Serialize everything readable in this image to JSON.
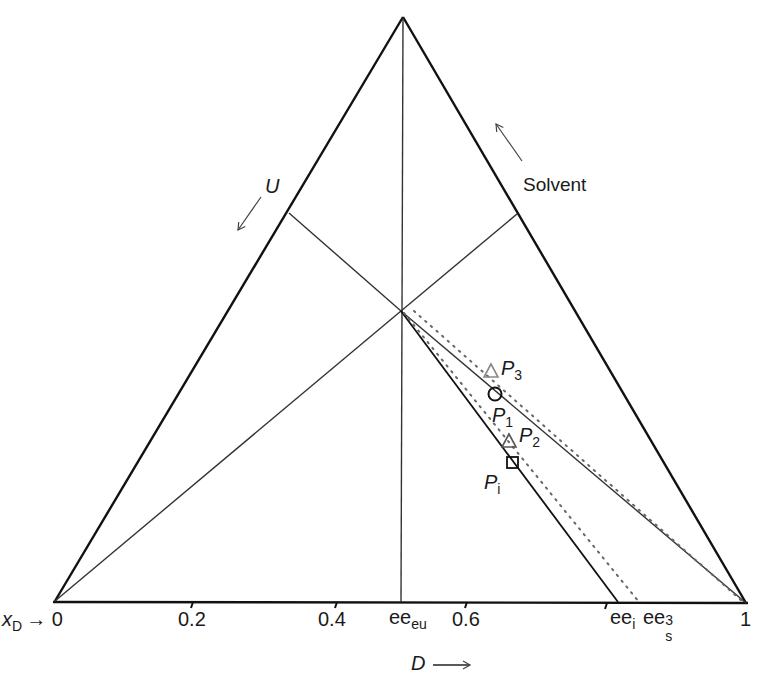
{
  "figure": {
    "type": "ternary-diagram",
    "vertices": {
      "apex": {
        "x": 403,
        "y": 17
      },
      "left": {
        "x": 55,
        "y": 601
      },
      "right": {
        "x": 746,
        "y": 603
      }
    },
    "center": {
      "x": 401,
      "y": 311
    },
    "labels": {
      "solvent": "Solvent",
      "u": "U",
      "d_axis": "D",
      "xd_prefix": "x",
      "xd_sub": "D",
      "xd_arrow": "→ 0",
      "tick_02": "0.2",
      "tick_04": "0.4",
      "tick_06": "0.6",
      "tick_1": "1",
      "ee_eu_main": "ee",
      "ee_eu_sub": "eu",
      "ee_i_main": "ee",
      "ee_i_sub": "i",
      "ee_s_main": "ee",
      "ee_s_sub": "s",
      "ee_s_sup": "3",
      "p3": "P",
      "p3_sub": "3",
      "p1": "P",
      "p1_sub": "1",
      "p2": "P",
      "p2_sub": "2",
      "pi": "P",
      "pi_sub": "i"
    },
    "points": [
      {
        "name": "P3",
        "marker": "triangle",
        "x": 491,
        "y": 372
      },
      {
        "name": "P1",
        "marker": "circle",
        "x": 495,
        "y": 394
      },
      {
        "name": "P2",
        "marker": "triangle",
        "x": 509,
        "y": 442
      },
      {
        "name": "Pi",
        "marker": "square",
        "x": 513,
        "y": 463
      }
    ],
    "colors": {
      "line": "#111111",
      "thin_line": "#333333",
      "marker_gray": "#888888",
      "text": "#1a1a1a"
    }
  }
}
